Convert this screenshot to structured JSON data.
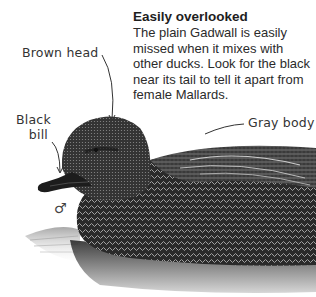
{
  "info": {
    "title": "Easily overlooked",
    "body": "The plain Gadwall is easily missed when it mixes with other ducks. Look for the black near its tail to tell it apart from female Mallards."
  },
  "labels": {
    "head": "Brown head",
    "bill_line1": "Black",
    "bill_line2": "bill",
    "body": "Gray body",
    "sex_symbol": "♂"
  },
  "colors": {
    "text": "#2a2a2a",
    "duck_dark": "#1a1a1a",
    "duck_mid": "#555555",
    "water": "#9a9a9a"
  }
}
